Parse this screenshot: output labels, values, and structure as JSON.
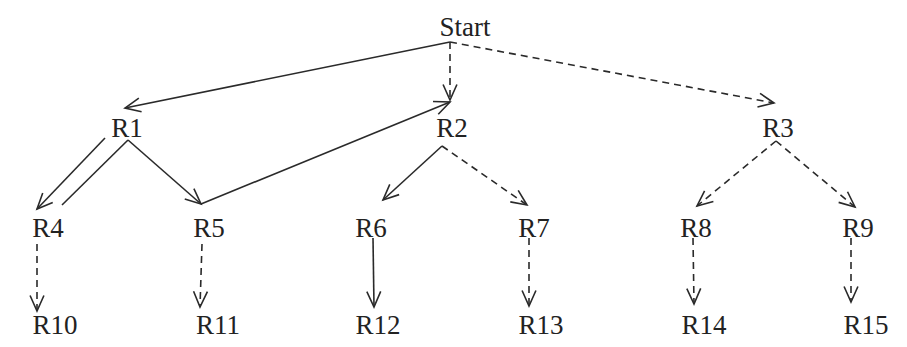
{
  "diagram": {
    "type": "tree",
    "nodes": [
      {
        "id": "start",
        "label": "Start",
        "x": 465,
        "y": 36
      },
      {
        "id": "r1",
        "label": "R1",
        "x": 127,
        "y": 137
      },
      {
        "id": "r2",
        "label": "R2",
        "x": 452,
        "y": 137
      },
      {
        "id": "r3",
        "label": "R3",
        "x": 778,
        "y": 137
      },
      {
        "id": "r4",
        "label": "R4",
        "x": 48,
        "y": 237
      },
      {
        "id": "r5",
        "label": "R5",
        "x": 209,
        "y": 237
      },
      {
        "id": "r6",
        "label": "R6",
        "x": 371,
        "y": 237
      },
      {
        "id": "r7",
        "label": "R7",
        "x": 534,
        "y": 237
      },
      {
        "id": "r8",
        "label": "R8",
        "x": 696,
        "y": 237
      },
      {
        "id": "r9",
        "label": "R9",
        "x": 858,
        "y": 237
      },
      {
        "id": "r10",
        "label": "R10",
        "x": 55,
        "y": 334
      },
      {
        "id": "r11",
        "label": "R11",
        "x": 218,
        "y": 334
      },
      {
        "id": "r12",
        "label": "R12",
        "x": 378,
        "y": 334
      },
      {
        "id": "r13",
        "label": "R13",
        "x": 541,
        "y": 334
      },
      {
        "id": "r14",
        "label": "R14",
        "x": 704,
        "y": 334
      },
      {
        "id": "r15",
        "label": "R15",
        "x": 866,
        "y": 334
      }
    ],
    "edges": [
      {
        "from": "start",
        "to": "r1",
        "style": "solid",
        "x1": 450,
        "y1": 42,
        "x2": 125,
        "y2": 108
      },
      {
        "from": "start",
        "to": "r2",
        "style": "dashed",
        "x1": 450,
        "y1": 42,
        "x2": 450,
        "y2": 100
      },
      {
        "from": "start",
        "to": "r3",
        "style": "dashed",
        "x1": 450,
        "y1": 42,
        "x2": 774,
        "y2": 103
      },
      {
        "from": "r1",
        "to": "r4",
        "style": "solid",
        "x1": 105,
        "y1": 138,
        "x2": 37,
        "y2": 209
      },
      {
        "from": "r4",
        "to": "r1",
        "style": "solid-undirected",
        "x1": 62,
        "y1": 205,
        "x2": 128,
        "y2": 140
      },
      {
        "from": "r1",
        "to": "r5",
        "style": "solid",
        "x1": 128,
        "y1": 140,
        "x2": 201,
        "y2": 204
      },
      {
        "from": "r5",
        "to": "r2",
        "style": "solid",
        "x1": 201,
        "y1": 204,
        "x2": 450,
        "y2": 102
      },
      {
        "from": "r2",
        "to": "r6",
        "style": "solid",
        "x1": 442,
        "y1": 146,
        "x2": 383,
        "y2": 200
      },
      {
        "from": "r2",
        "to": "r7",
        "style": "dashed",
        "x1": 442,
        "y1": 146,
        "x2": 527,
        "y2": 205
      },
      {
        "from": "r3",
        "to": "r8",
        "style": "dashed",
        "x1": 776,
        "y1": 141,
        "x2": 697,
        "y2": 206
      },
      {
        "from": "r3",
        "to": "r9",
        "style": "dashed",
        "x1": 776,
        "y1": 141,
        "x2": 855,
        "y2": 207
      },
      {
        "from": "r4",
        "to": "r10",
        "style": "dashed",
        "x1": 37,
        "y1": 244,
        "x2": 37,
        "y2": 311
      },
      {
        "from": "r5",
        "to": "r11",
        "style": "dashed",
        "x1": 202,
        "y1": 244,
        "x2": 200,
        "y2": 307
      },
      {
        "from": "r6",
        "to": "r12",
        "style": "solid",
        "x1": 373,
        "y1": 238,
        "x2": 374,
        "y2": 307
      },
      {
        "from": "r7",
        "to": "r13",
        "style": "dashed",
        "x1": 529,
        "y1": 238,
        "x2": 529,
        "y2": 306
      },
      {
        "from": "r8",
        "to": "r14",
        "style": "dashed",
        "x1": 693,
        "y1": 238,
        "x2": 694,
        "y2": 304
      },
      {
        "from": "r9",
        "to": "r15",
        "style": "dashed",
        "x1": 851,
        "y1": 238,
        "x2": 851,
        "y2": 302
      }
    ],
    "colors": {
      "line": "#2a2a2a",
      "text": "#222222",
      "background": "#ffffff"
    }
  }
}
